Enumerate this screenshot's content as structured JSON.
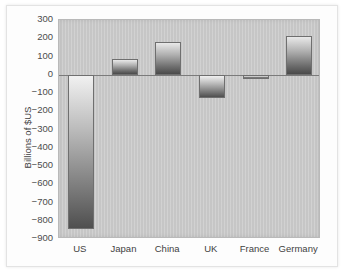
{
  "chart_data": {
    "type": "bar",
    "title": "",
    "xlabel": "",
    "ylabel": "Billions of $US",
    "categories": [
      "US",
      "Japan",
      "China",
      "UK",
      "France",
      "Germany"
    ],
    "values": [
      -846,
      88,
      180,
      -125,
      -25,
      210
    ],
    "ylim": [
      -900,
      300
    ],
    "ytick_values": [
      300,
      200,
      100,
      0,
      -100,
      -200,
      -300,
      -400,
      -500,
      -600,
      -700,
      -800,
      -900
    ],
    "ytick_labels": [
      "300",
      "200",
      "100",
      "0",
      "−100",
      "−200",
      "−300",
      "−400",
      "−500",
      "−600",
      "−700",
      "−800",
      "−900"
    ],
    "grid": false,
    "legend": null,
    "zero_line": 0,
    "colors": {
      "plot_background": "#c9c9c9",
      "bar_gradient_top": "#ececec",
      "bar_gradient_bottom": "#4a4a4a",
      "bar_outline": "#6f6f6f",
      "axis_text": "#3f3f3f",
      "zero_line": "#7b7b7b",
      "figure_background": "#ffffff"
    }
  }
}
